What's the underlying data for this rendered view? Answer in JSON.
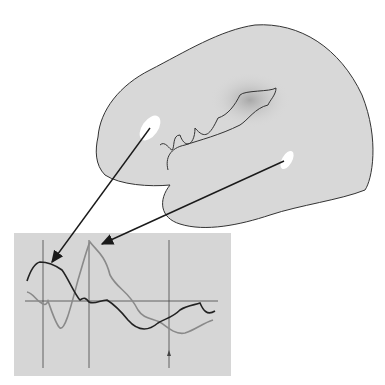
{
  "figure": {
    "type": "brain-diagram-with-waveform-inset",
    "colors": {
      "background": "#ffffff",
      "brain_fill": "#d8d8d8",
      "brain_outline": "#333333",
      "hotspot": "#ffffff",
      "dark_region": "#b4b4b4",
      "inset_bg": "#d6d6d6",
      "trace_dark": "#222222",
      "trace_light": "#8a8a8a",
      "arrow": "#1a1a1a"
    },
    "inset": {
      "vertical_markers": 3,
      "baseline": true,
      "small_arrow_marker": true
    },
    "callouts": [
      {
        "from": "frontal-hotspot",
        "to": "dark-trace-peak"
      },
      {
        "from": "temporal-hotspot",
        "to": "light-trace-peak"
      }
    ]
  }
}
